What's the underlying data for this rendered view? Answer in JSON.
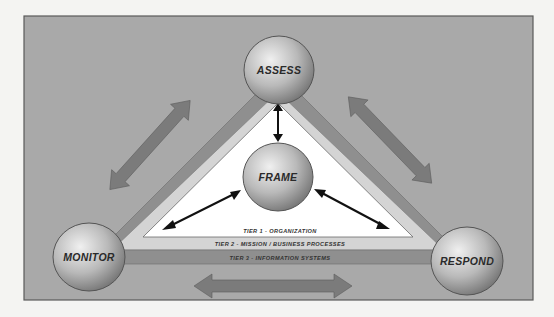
{
  "diagram": {
    "type": "risk-management-process",
    "nodes": [
      {
        "id": "assess",
        "label": "ASSESS"
      },
      {
        "id": "frame",
        "label": "FRAME"
      },
      {
        "id": "monitor",
        "label": "MONITOR"
      },
      {
        "id": "respond",
        "label": "RESPOND"
      }
    ],
    "tiers": [
      {
        "id": "tier1",
        "label": "TIER 1 - ORGANIZATION"
      },
      {
        "id": "tier2",
        "label": "TIER 2 - MISSION / BUSINESS PROCESSES"
      },
      {
        "id": "tier3",
        "label": "TIER 3 - INFORMATION SYSTEMS"
      }
    ],
    "edges": [
      {
        "from": "frame",
        "to": "assess",
        "style": "double-arrow-thin"
      },
      {
        "from": "frame",
        "to": "monitor",
        "style": "double-arrow-thin"
      },
      {
        "from": "frame",
        "to": "respond",
        "style": "double-arrow-thin"
      },
      {
        "from": "assess",
        "to": "monitor",
        "style": "double-arrow-wide"
      },
      {
        "from": "assess",
        "to": "respond",
        "style": "double-arrow-wide"
      },
      {
        "from": "monitor",
        "to": "respond",
        "style": "double-arrow-wide"
      }
    ],
    "colors": {
      "background": "#a9a9a9",
      "panel_border": "#5a5a5a",
      "inner_triangle": "#ffffff",
      "tier2_band": "#d2d2d2",
      "tier3_band": "#8f8f8f",
      "wide_arrow": "#7b7b7b",
      "circle_light": "#e8e8e8",
      "circle_dark": "#7a7a7a"
    }
  }
}
